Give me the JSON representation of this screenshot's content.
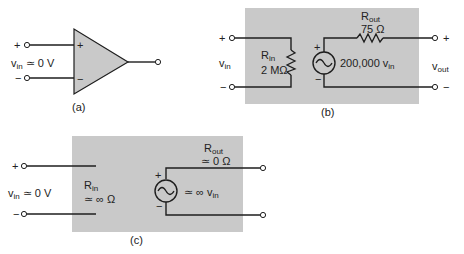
{
  "figure_a": {
    "caption": "(a)",
    "plus_terminal": "+",
    "minus_terminal": "−",
    "opamp_plus": "+",
    "opamp_minus": "−",
    "vin_label": "v",
    "vin_sub": "in",
    "vin_value": " ≃ 0 V"
  },
  "figure_b": {
    "caption": "(b)",
    "vin_label": "v",
    "vin_sub": "in",
    "rin_label": "R",
    "rin_sub": "in",
    "rin_value": "2 MΩ",
    "rout_label": "R",
    "rout_sub": "out",
    "rout_value": "75 Ω",
    "source_plus": "+",
    "source_minus": "−",
    "source_gain": "200,000 v",
    "source_gain_sub": "in",
    "vout_label": "v",
    "vout_sub": "out",
    "in_plus": "+",
    "in_minus": "−",
    "out_plus": "+",
    "out_minus": "−"
  },
  "figure_c": {
    "caption": "(c)",
    "vin_label": "v",
    "vin_sub": "in",
    "vin_value": " ≃ 0 V",
    "rin_label": "R",
    "rin_sub": "in",
    "rin_value": "≃ ∞ Ω",
    "rout_label": "R",
    "rout_sub": "out",
    "rout_value": "≃ 0 Ω",
    "source_plus": "+",
    "source_minus": "−",
    "source_gain": "≃ ∞ v",
    "source_gain_sub": "in",
    "in_plus": "+",
    "in_minus": "−"
  },
  "colors": {
    "box_fill": "#c9c9c9",
    "line": "#1e1e1e",
    "background": "#ffffff"
  }
}
